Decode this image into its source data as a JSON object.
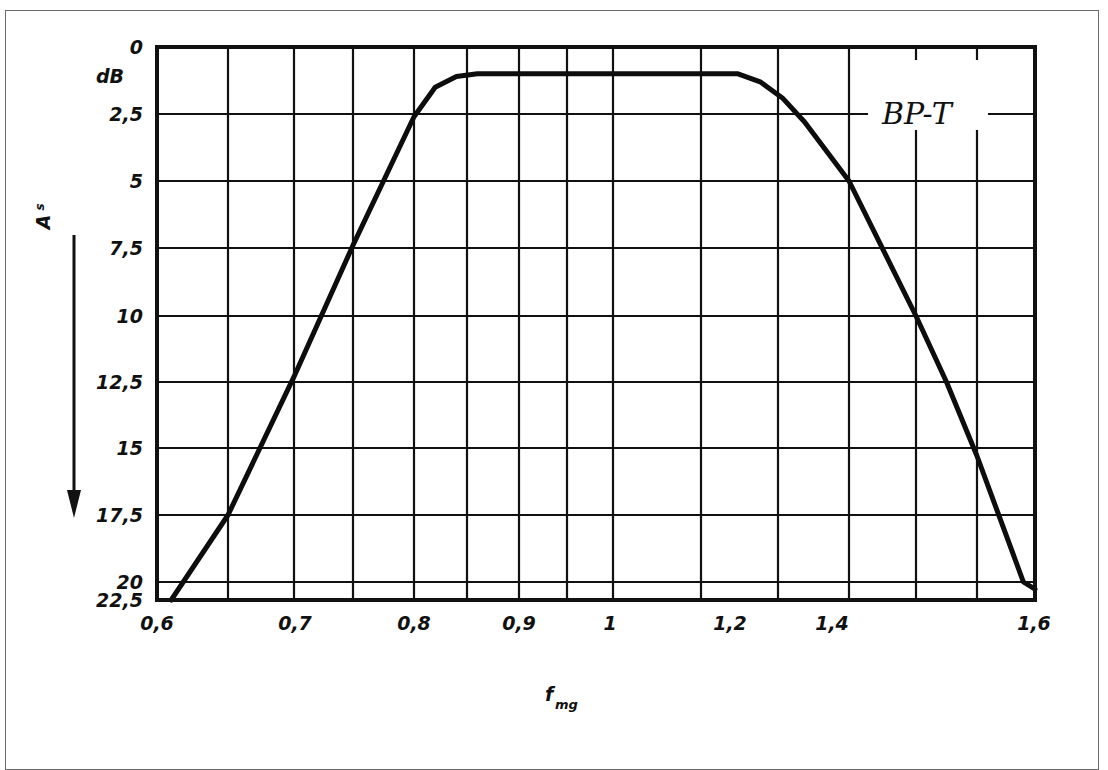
{
  "chart_data": {
    "type": "line",
    "title": "",
    "xlabel": "f",
    "xlabel_sub": "mg",
    "ylabel": "A",
    "ylabel_sub": "s",
    "yunit": "dB",
    "y_direction": "down",
    "grid": true,
    "ylim": [
      0,
      22.5
    ],
    "xlim": [
      0.6,
      1.6
    ],
    "yticks": [
      "0",
      "2,5",
      "5",
      "7,5",
      "10",
      "12,5",
      "15",
      "17,5",
      "20",
      "22,5"
    ],
    "yticks_values": [
      0,
      2.5,
      5,
      7.5,
      10,
      12.5,
      15,
      17.5,
      20,
      22.5
    ],
    "xticks": [
      "0,6",
      "0,7",
      "0,8",
      "0,9",
      "1",
      "1,2",
      "1,4",
      "1,6"
    ],
    "xticks_values": [
      0.6,
      0.7,
      0.8,
      0.9,
      1.0,
      1.2,
      1.4,
      1.6
    ],
    "legend": "BP-T",
    "legend_position": "top-right",
    "series": [
      {
        "name": "BP-T",
        "x": [
          0.61,
          0.65,
          0.7,
          0.75,
          0.8,
          0.82,
          0.84,
          0.86,
          1.0,
          1.2,
          1.22,
          1.24,
          1.26,
          1.3,
          1.4,
          1.45,
          1.5,
          1.58,
          1.6
        ],
        "y": [
          22.5,
          17.5,
          12.3,
          7.4,
          2.6,
          1.5,
          1.1,
          1.0,
          1.0,
          1.0,
          1.3,
          1.9,
          2.8,
          5.0,
          10.0,
          12.5,
          15.3,
          20.0,
          21.0
        ]
      }
    ]
  }
}
